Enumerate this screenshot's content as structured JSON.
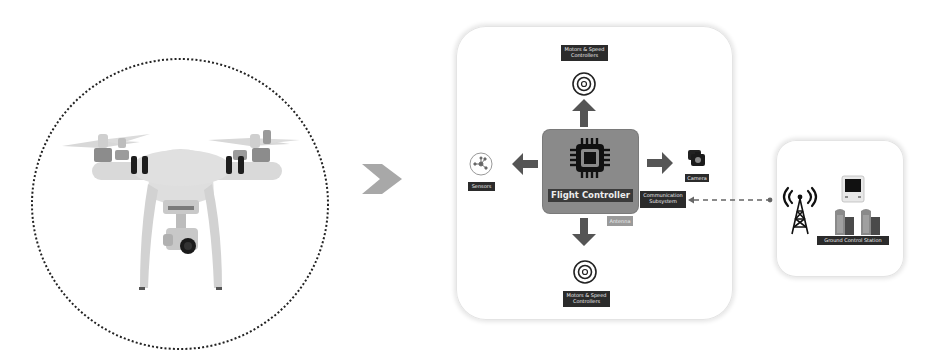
{
  "diagram": {
    "drone": {
      "name": "Quadcopter drone with camera gimbal"
    },
    "transition_arrow": "chevron-right",
    "architecture_panel": {
      "center": {
        "label": "Flight Controller",
        "icon": "cpu-chip-icon"
      },
      "top": {
        "label": "Motors & Speed\nControllers",
        "icon": "motor-icon",
        "arrow": "up"
      },
      "bottom": {
        "label": "Motors & Speed\nControllers",
        "icon": "motor-icon",
        "arrow": "down"
      },
      "left": {
        "label": "Sensors",
        "icon": "sensor-network-icon",
        "arrow": "left"
      },
      "right": {
        "label": "Camera",
        "icon": "camera-icon",
        "arrow": "right"
      },
      "comms": {
        "label": "Communication\nSubsystem"
      },
      "antenna": {
        "label": "Antenna"
      }
    },
    "link": {
      "style": "dashed",
      "direction": "bidirectional"
    },
    "ground_panel": {
      "label": "Ground Control Station",
      "icons": [
        "radio-tower-icon",
        "monitor-icon",
        "server-icon",
        "server-icon"
      ]
    },
    "colors": {
      "label_bg": "#2b2b2b",
      "fc_box": "#8a8a8a",
      "arrow": "#555555",
      "chevron": "#a8a8a8",
      "dotted_circle": "#222222"
    }
  }
}
